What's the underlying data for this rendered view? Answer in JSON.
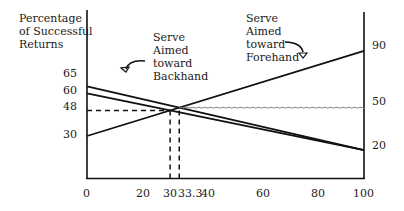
{
  "chart_data": {
    "type": "line",
    "title": "",
    "ylabel": "Percentage of Successful Returns",
    "xlabel": "",
    "xlim": [
      0,
      100
    ],
    "ylim_left": [
      0,
      100
    ],
    "x_ticks": [
      "0",
      "20",
      "30",
      "33.3",
      "40",
      "60",
      "80",
      "100"
    ],
    "y_ticks_left": [
      "65",
      "60",
      "48",
      "30"
    ],
    "y_ticks_right": [
      "90",
      "50",
      "20"
    ],
    "series": [
      {
        "name": "Serve Aimed toward Forehand",
        "x": [
          0,
          100
        ],
        "y": [
          30,
          90
        ]
      },
      {
        "name": "Serve Aimed toward Backhand (upper)",
        "x": [
          0,
          100
        ],
        "y": [
          65,
          20
        ]
      },
      {
        "name": "Serve Aimed toward Backhand (lower)",
        "x": [
          0,
          100
        ],
        "y": [
          60,
          20
        ]
      }
    ],
    "reference_lines": [
      {
        "type": "horizontal-dashed",
        "y": 48,
        "x_from": 0,
        "x_to": 30
      },
      {
        "type": "vertical-dashed",
        "x": 30,
        "y_from": 0,
        "y_to": 48
      },
      {
        "type": "vertical-dashed",
        "x": 33.3,
        "y_from": 0,
        "y_to": 50
      },
      {
        "type": "horizontal-wavy",
        "y": 50,
        "x_from": 33.3,
        "x_to": 100
      }
    ],
    "annotations": [
      {
        "text": "Serve Aimed toward Backhand",
        "arrow": "curved-down-left"
      },
      {
        "text": "Serve Aimed toward Forehand",
        "arrow": "curved-down-right"
      }
    ],
    "grid": false,
    "legend": "none"
  },
  "labels": {
    "ylabel_line1": "Percentage",
    "ylabel_line2": "of Successful",
    "ylabel_line3": "Returns",
    "backhand": "Serve\nAimed\ntoward\nBackhand",
    "forehand": "Serve\nAimed\ntoward\nForehand"
  }
}
